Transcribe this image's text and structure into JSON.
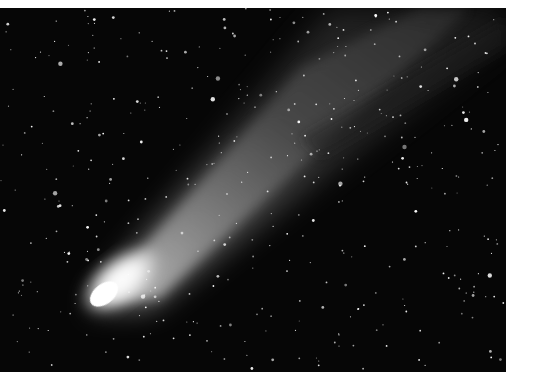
{
  "image": {
    "subject": "comet with long diffuse tail against a dense starfield",
    "palette": {
      "sky": "#060606",
      "tail": "#8a8a8a",
      "coma": "#ffffff",
      "border": "#ffffff"
    },
    "comet": {
      "head_x": 102,
      "head_y": 288,
      "tail_end_x": 506,
      "tail_end_y": 8
    },
    "star_count": 420
  }
}
